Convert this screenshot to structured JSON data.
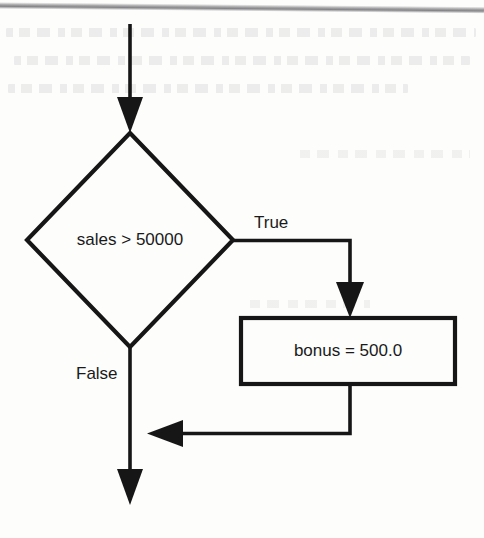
{
  "diagram": {
    "type": "flowchart",
    "nodes": [
      {
        "id": "decision-sales",
        "shape": "diamond",
        "text": "sales > 50000",
        "center": [
          130,
          240
        ],
        "half_width": 103,
        "half_height": 107
      },
      {
        "id": "process-bonus",
        "shape": "rectangle",
        "text": "bonus = 500.0",
        "x": 241,
        "y": 318,
        "width": 214,
        "height": 66
      }
    ],
    "edge_labels": [
      {
        "id": "label-true",
        "text": "True",
        "x": 254,
        "y": 224
      },
      {
        "id": "label-false",
        "text": "False",
        "x": 76,
        "y": 375
      }
    ],
    "edges": [
      {
        "id": "edge-entry",
        "from": "top",
        "to": "decision-sales",
        "label": ""
      },
      {
        "id": "edge-true",
        "from": "decision-sales",
        "to": "process-bonus",
        "label": "True"
      },
      {
        "id": "edge-false",
        "from": "decision-sales",
        "to": "exit",
        "label": "False"
      },
      {
        "id": "edge-merge",
        "from": "process-bonus",
        "to": "edge-false",
        "label": ""
      }
    ],
    "colors": {
      "stroke": "#161616",
      "text": "#1a1a1a",
      "background": "#fdfdfc",
      "rule": "#78787c"
    }
  }
}
